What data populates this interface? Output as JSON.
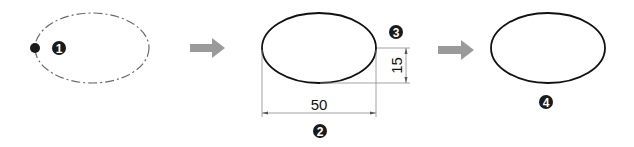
{
  "colors": {
    "stroke": "#111111",
    "dashed_stroke": "#6b6b6b",
    "arrow": "#9a9a9a",
    "dimension_line": "#8a8a8a",
    "badge_fill": "#1a1a1a",
    "badge_text": "#ffffff"
  },
  "steps": [
    {
      "id": 1,
      "badge": "1",
      "description": "dashed ellipse with start point"
    },
    {
      "id": 2,
      "badge": "2",
      "description": "width dimension"
    },
    {
      "id": 3,
      "badge": "3",
      "description": "height dimension"
    },
    {
      "id": 4,
      "badge": "4",
      "description": "resulting ellipse"
    }
  ],
  "dimensions": {
    "width": "50",
    "height": "15"
  },
  "arrows": [
    {
      "icon": "right-arrow-icon"
    },
    {
      "icon": "right-arrow-icon"
    }
  ]
}
